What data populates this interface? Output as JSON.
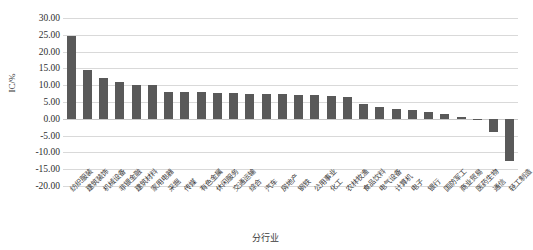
{
  "chart_data": {
    "type": "bar",
    "title": "",
    "xlabel": "分行业",
    "ylabel": "IC/%",
    "ylim": [
      -20.0,
      30.0
    ],
    "ystep": 5.0,
    "grid": true,
    "legend": "none",
    "bar_color": "#595959",
    "ytick_labels": [
      "30.00",
      "25.00",
      "20.00",
      "15.00",
      "10.00",
      "5.00",
      "0.00",
      "-5.00",
      "-10.00",
      "-15.00",
      "-20.00"
    ],
    "ytick_values": [
      30.0,
      25.0,
      20.0,
      15.0,
      10.0,
      5.0,
      0.0,
      -5.0,
      -10.0,
      -15.0,
      -20.0
    ],
    "categories": [
      "纺织服装",
      "建筑装饰",
      "机械设备",
      "非银金融",
      "建筑材料",
      "家用电器",
      "采掘",
      "传媒",
      "有色金属",
      "休闲服务",
      "交通运输",
      "综合",
      "汽车",
      "房地产",
      "钢铁",
      "公用事业",
      "化工",
      "农林牧渔",
      "食品饮料",
      "电气设备",
      "计算机",
      "电子",
      "银行",
      "国防军工",
      "商业贸易",
      "医药生物",
      "通信",
      "轻工制造"
    ],
    "values": [
      24.7,
      14.4,
      12.2,
      11.1,
      10.1,
      10.1,
      8.1,
      8.1,
      8.0,
      7.7,
      7.6,
      7.5,
      7.4,
      7.3,
      7.2,
      7.0,
      6.9,
      6.5,
      4.3,
      3.6,
      2.9,
      2.7,
      1.9,
      1.3,
      0.4,
      -0.1,
      -4.0,
      -12.5
    ]
  }
}
